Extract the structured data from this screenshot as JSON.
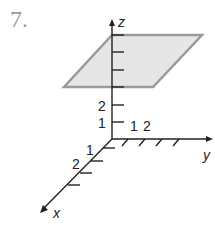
{
  "problem": {
    "number": "7."
  },
  "diagram": {
    "axes": {
      "x_label": "x",
      "y_label": "y",
      "z_label": "z"
    },
    "tick_labels": {
      "z": [
        "1",
        "2"
      ],
      "y": [
        "1",
        "2"
      ],
      "x": [
        "1",
        "2"
      ]
    },
    "plane": {
      "description": "horizontal plane z = 6 (shaded parallelogram)",
      "z_value": 6,
      "fill": "#e6e6e6",
      "stroke": "#9b9b9b"
    },
    "colors": {
      "axis": "#222222",
      "plane_fill": "#e6e6e6",
      "plane_edge": "#9b9b9b",
      "number": "#9a9a9a"
    }
  }
}
